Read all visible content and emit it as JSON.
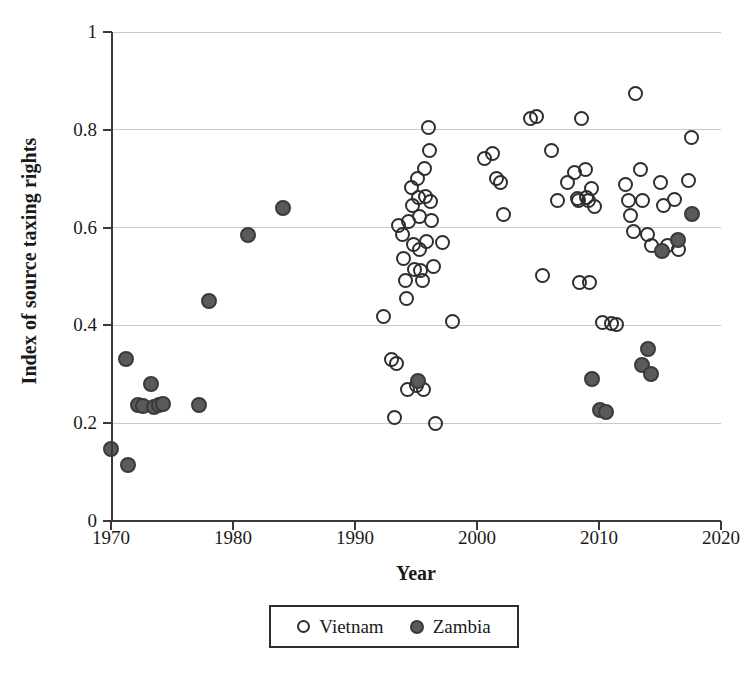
{
  "chart_data": {
    "type": "scatter",
    "title": "",
    "xlabel": "Year",
    "ylabel": "Index of source taxing rights",
    "xlim": [
      1970,
      2020
    ],
    "ylim": [
      0,
      1
    ],
    "xticks": [
      1970,
      1980,
      1990,
      2000,
      2010,
      2020
    ],
    "yticks": [
      0,
      0.2,
      0.4,
      0.6,
      0.8,
      1
    ],
    "grid": "horizontal",
    "legend_position": "bottom-center",
    "series": [
      {
        "name": "Vietnam",
        "marker": "open-circle",
        "color": "#ffffff",
        "edge_color": "#2e2e2e",
        "points": [
          [
            1992.3,
            0.418
          ],
          [
            1993.0,
            0.33
          ],
          [
            1993.2,
            0.212
          ],
          [
            1993.4,
            0.322
          ],
          [
            1993.6,
            0.605
          ],
          [
            1993.9,
            0.585
          ],
          [
            1994.0,
            0.537
          ],
          [
            1994.1,
            0.492
          ],
          [
            1994.2,
            0.455
          ],
          [
            1994.3,
            0.268
          ],
          [
            1994.4,
            0.613
          ],
          [
            1994.6,
            0.682
          ],
          [
            1994.7,
            0.645
          ],
          [
            1994.8,
            0.565
          ],
          [
            1994.9,
            0.515
          ],
          [
            1995.0,
            0.278
          ],
          [
            1995.1,
            0.7
          ],
          [
            1995.2,
            0.662
          ],
          [
            1995.25,
            0.623
          ],
          [
            1995.3,
            0.555
          ],
          [
            1995.4,
            0.513
          ],
          [
            1995.5,
            0.492
          ],
          [
            1995.6,
            0.268
          ],
          [
            1995.7,
            0.72
          ],
          [
            1995.8,
            0.663
          ],
          [
            1995.9,
            0.572
          ],
          [
            1996.0,
            0.805
          ],
          [
            1996.1,
            0.757
          ],
          [
            1996.2,
            0.653
          ],
          [
            1996.3,
            0.615
          ],
          [
            1996.4,
            0.52
          ],
          [
            1996.6,
            0.2
          ],
          [
            1997.2,
            0.57
          ],
          [
            1998.0,
            0.408
          ],
          [
            2000.6,
            0.742
          ],
          [
            2001.3,
            0.752
          ],
          [
            2001.6,
            0.7
          ],
          [
            2001.9,
            0.693
          ],
          [
            2002.2,
            0.627
          ],
          [
            2004.4,
            0.823
          ],
          [
            2004.9,
            0.828
          ],
          [
            2005.4,
            0.502
          ],
          [
            2006.1,
            0.758
          ],
          [
            2006.6,
            0.655
          ],
          [
            2007.4,
            0.693
          ],
          [
            2008.0,
            0.712
          ],
          [
            2008.2,
            0.66
          ],
          [
            2008.3,
            0.655
          ],
          [
            2008.4,
            0.488
          ],
          [
            2008.6,
            0.823
          ],
          [
            2008.9,
            0.718
          ],
          [
            2009.0,
            0.662
          ],
          [
            2009.1,
            0.655
          ],
          [
            2009.2,
            0.487
          ],
          [
            2009.4,
            0.68
          ],
          [
            2009.6,
            0.643
          ],
          [
            2010.3,
            0.405
          ],
          [
            2011.0,
            0.403
          ],
          [
            2011.4,
            0.402
          ],
          [
            2012.2,
            0.688
          ],
          [
            2012.4,
            0.655
          ],
          [
            2012.6,
            0.625
          ],
          [
            2012.8,
            0.593
          ],
          [
            2013.0,
            0.875
          ],
          [
            2013.4,
            0.718
          ],
          [
            2013.6,
            0.655
          ],
          [
            2014.0,
            0.585
          ],
          [
            2014.3,
            0.563
          ],
          [
            2015.0,
            0.692
          ],
          [
            2015.3,
            0.645
          ],
          [
            2015.6,
            0.563
          ],
          [
            2016.2,
            0.657
          ],
          [
            2016.5,
            0.555
          ],
          [
            2017.3,
            0.697
          ],
          [
            2017.6,
            0.785
          ]
        ]
      },
      {
        "name": "Zambia",
        "marker": "filled-circle",
        "color": "#5a5a5a",
        "edge_color": "#3a3a3a",
        "points": [
          [
            1970.0,
            0.148
          ],
          [
            1971.2,
            0.332
          ],
          [
            1971.4,
            0.115
          ],
          [
            1972.2,
            0.237
          ],
          [
            1972.6,
            0.235
          ],
          [
            1973.3,
            0.28
          ],
          [
            1973.5,
            0.233
          ],
          [
            1973.9,
            0.237
          ],
          [
            1974.3,
            0.24
          ],
          [
            1977.2,
            0.238
          ],
          [
            1978.0,
            0.45
          ],
          [
            1981.2,
            0.585
          ],
          [
            1984.1,
            0.64
          ],
          [
            1995.2,
            0.287
          ],
          [
            2009.4,
            0.29
          ],
          [
            2010.1,
            0.228
          ],
          [
            2010.6,
            0.222
          ],
          [
            2013.5,
            0.32
          ],
          [
            2014.0,
            0.352
          ],
          [
            2014.3,
            0.3
          ],
          [
            2015.2,
            0.552
          ],
          [
            2016.5,
            0.575
          ],
          [
            2017.6,
            0.628
          ]
        ]
      }
    ]
  },
  "legend": {
    "entries": [
      {
        "label": "Vietnam",
        "marker": "open-circle"
      },
      {
        "label": "Zambia",
        "marker": "filled-circle"
      }
    ]
  }
}
